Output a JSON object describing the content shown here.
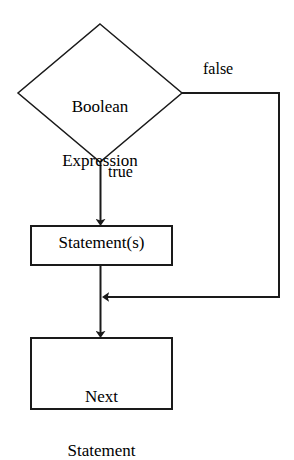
{
  "diagram": {
    "type": "flowchart",
    "canvas": {
      "width": 294,
      "height": 422,
      "background": "#ffffff"
    },
    "stroke_color": "#1a1a1a",
    "text_color": "#000000",
    "nodes": [
      {
        "id": "decision",
        "shape": "diamond",
        "text": "Boolean\nExpression",
        "line1": "Boolean",
        "line2": "Expression",
        "cx": 100,
        "cy": 93,
        "half_width": 82,
        "half_height": 69
      },
      {
        "id": "process",
        "shape": "rectangle",
        "text": "Statement(s)",
        "x": 31,
        "y": 226,
        "width": 141,
        "height": 39
      },
      {
        "id": "terminal",
        "shape": "rectangle",
        "text": "Next\nStatement",
        "line1": "Next",
        "line2": "Statement",
        "x": 31,
        "y": 338,
        "width": 141,
        "height": 71
      }
    ],
    "edges": [
      {
        "id": "edge-true",
        "label": "true",
        "from": "decision",
        "to": "process",
        "arrow": true,
        "direction": "down"
      },
      {
        "id": "edge-false",
        "label": "false",
        "from": "decision",
        "to": "merge",
        "arrow": true,
        "direction": "right-down-left"
      },
      {
        "id": "edge-process-to-terminal",
        "label": "",
        "from": "process",
        "to": "terminal",
        "arrow": true,
        "direction": "down"
      }
    ]
  }
}
